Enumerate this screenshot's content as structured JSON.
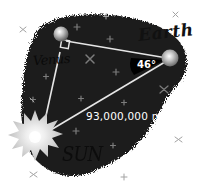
{
  "diagram": {
    "type": "right-triangle-astronomy",
    "bodies": {
      "earth": {
        "label": "Earth"
      },
      "venus": {
        "label": "Venus"
      },
      "sun": {
        "label": "SUN"
      }
    },
    "angle_at_earth": "46°",
    "right_angle_at": "Venus",
    "distance_sun_earth": "93,000,000 mi"
  },
  "colors": {
    "space": "#1c1c1c",
    "line": "#e8e8e8",
    "planet": "#cfcfcf",
    "sun": "#d9d9d9",
    "star": "#8a8a8a",
    "label_dark": "#111111",
    "label_light": "#ffffff"
  }
}
